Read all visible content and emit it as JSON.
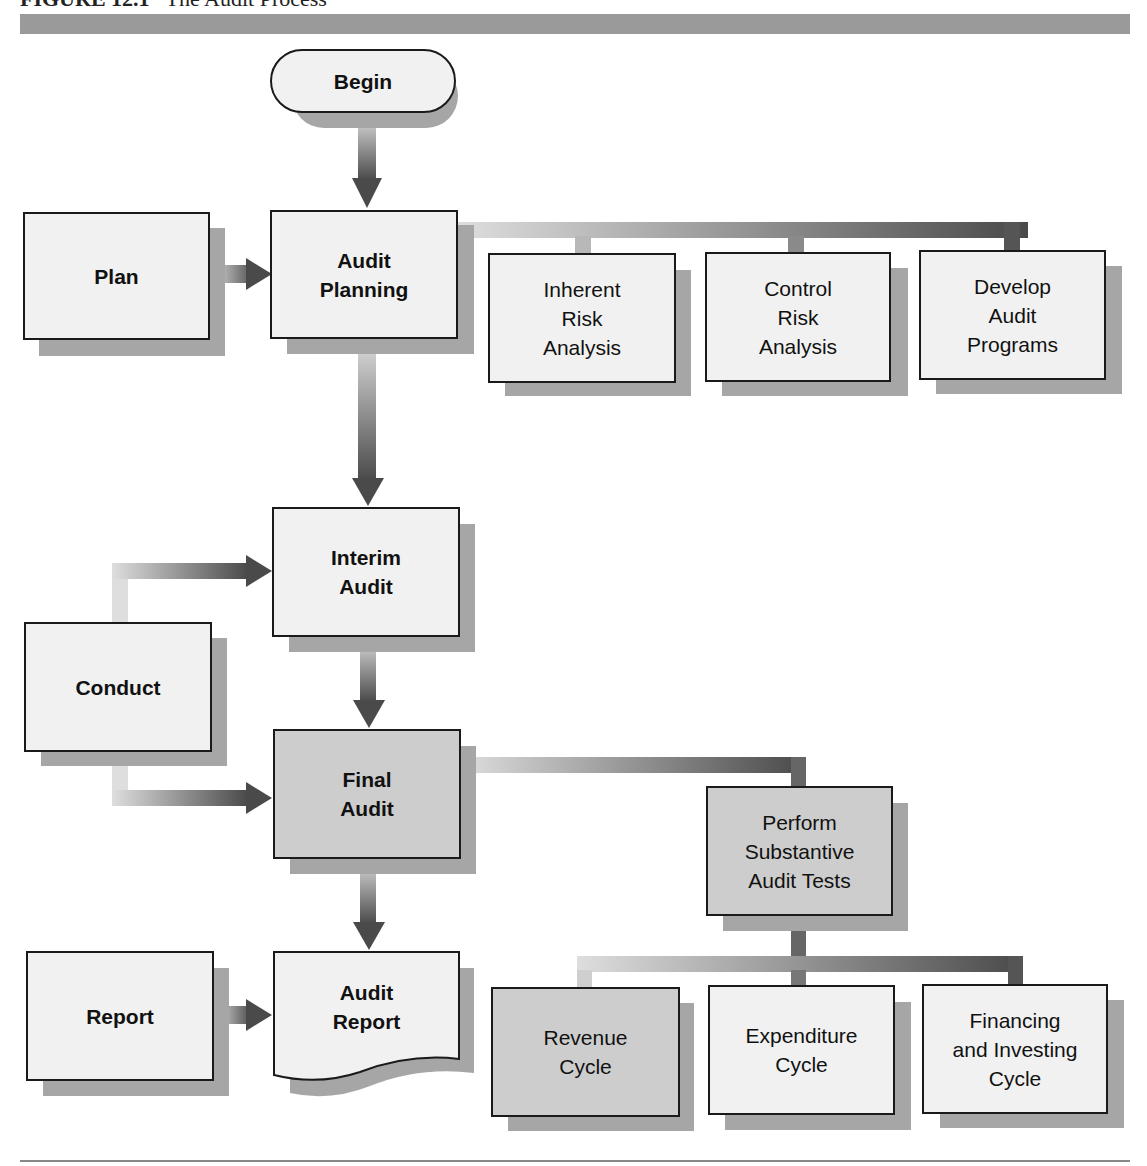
{
  "figure": {
    "label": "FIGURE 12.1",
    "title": "The Audit Process"
  },
  "nodes": {
    "begin": "Begin",
    "plan": "Plan",
    "audit_planning": "Audit\nPlanning",
    "inherent_risk": "Inherent\nRisk\nAnalysis",
    "control_risk": "Control\nRisk\nAnalysis",
    "develop_programs": "Develop\nAudit\nPrograms",
    "interim_audit": "Interim\nAudit",
    "conduct": "Conduct",
    "final_audit": "Final\nAudit",
    "substantive_tests": "Perform\nSubstantive\nAudit Tests",
    "report": "Report",
    "audit_report": "Audit\nReport",
    "revenue_cycle": "Revenue\nCycle",
    "expenditure_cycle": "Expenditure\nCycle",
    "financing_cycle": "Financing\nand Investing\nCycle"
  },
  "colors": {
    "box_fill": "#f1f1f1",
    "box_fill_dark": "#cdcdcd",
    "shadow": "#a6a6a6",
    "arrow_dark": "#4a4a4a",
    "arrow_light": "#dedede"
  }
}
